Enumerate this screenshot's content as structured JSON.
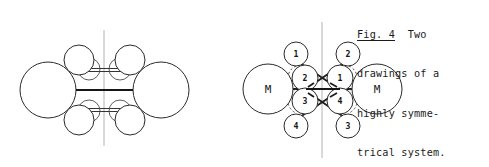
{
  "figure": {
    "caption": {
      "label": "Fig. 4",
      "lines": [
        "Fig. 4  Two",
        "drawings of a",
        "highly symme-",
        "trical system."
      ],
      "full_text": "Fig. 4  Two drawings of a highly symmetrical system."
    },
    "colors": {
      "ink": "#161616",
      "outline": "#2a2a2a",
      "mirror_line": "#a9a9a9",
      "background": "#ffffff"
    },
    "left_diagram": {
      "name": "space-filling-drawing",
      "mirror_axis_label": "",
      "metal_atoms": [
        {
          "id": "metal-left",
          "cx": 48,
          "cy": 90,
          "r": 28
        },
        {
          "id": "metal-right",
          "cx": 161,
          "cy": 90,
          "r": 28
        }
      ],
      "ligand_atoms": [
        {
          "id": "top-left-outer",
          "cx": 79,
          "cy": 60,
          "r": 15
        },
        {
          "id": "top-left-inner",
          "cx": 89,
          "cy": 68,
          "r": 11
        },
        {
          "id": "top-right-outer",
          "cx": 130,
          "cy": 60,
          "r": 15
        },
        {
          "id": "top-right-inner",
          "cx": 120,
          "cy": 68,
          "r": 11
        },
        {
          "id": "bottom-left-outer",
          "cx": 79,
          "cy": 120,
          "r": 15
        },
        {
          "id": "bottom-left-inner",
          "cx": 89,
          "cy": 112,
          "r": 11
        },
        {
          "id": "bottom-right-outer",
          "cx": 130,
          "cy": 120,
          "r": 15
        },
        {
          "id": "bottom-right-inner",
          "cx": 120,
          "cy": 112,
          "r": 11
        }
      ],
      "bonds": [
        {
          "id": "metal-metal-bond",
          "x1": 76,
          "y1": 90,
          "x2": 133,
          "y2": 90,
          "weight": "heavy"
        },
        {
          "id": "top-bridge-bond",
          "x1": 88,
          "y1": 70,
          "x2": 121,
          "y2": 70,
          "weight": "thin"
        },
        {
          "id": "bottom-bridge-bond",
          "x1": 88,
          "y1": 110,
          "x2": 121,
          "y2": 110,
          "weight": "thin"
        }
      ]
    },
    "right_diagram": {
      "name": "schematic-drawing",
      "metal_nodes": [
        {
          "id": "metal-left",
          "label": "M",
          "cx": 268,
          "cy": 89,
          "r": 25
        },
        {
          "id": "metal-right",
          "label": "M",
          "cx": 377,
          "cy": 89,
          "r": 25
        }
      ],
      "ligand_nodes": [
        {
          "id": "node-top-left",
          "label": "1",
          "cx": 296,
          "cy": 54,
          "r": 12
        },
        {
          "id": "node-top-right",
          "label": "2",
          "cx": 348,
          "cy": 54,
          "r": 12
        },
        {
          "id": "node-inner-upper-left",
          "label": "2",
          "cx": 305,
          "cy": 78,
          "r": 13
        },
        {
          "id": "node-inner-upper-right",
          "label": "1",
          "cx": 340,
          "cy": 78,
          "r": 13
        },
        {
          "id": "node-inner-lower-left",
          "label": "3",
          "cx": 305,
          "cy": 101,
          "r": 13
        },
        {
          "id": "node-inner-lower-right",
          "label": "4",
          "cx": 340,
          "cy": 101,
          "r": 13
        },
        {
          "id": "node-bottom-left",
          "label": "4",
          "cx": 296,
          "cy": 126,
          "r": 12
        },
        {
          "id": "node-bottom-right",
          "label": "3",
          "cx": 348,
          "cy": 126,
          "r": 12
        }
      ],
      "bonds": [
        {
          "id": "metal-metal-bond",
          "x1": 292,
          "y1": 89,
          "x2": 353,
          "y2": 89,
          "weight": "heavy"
        },
        {
          "id": "cross-bond-upper-a",
          "x1": 299,
          "y1": 62,
          "x2": 337,
          "y2": 86,
          "weight": "mid"
        },
        {
          "id": "cross-bond-upper-b",
          "x1": 345,
          "y1": 62,
          "x2": 308,
          "y2": 86,
          "weight": "mid"
        },
        {
          "id": "cross-bond-lower-a",
          "x1": 299,
          "y1": 118,
          "x2": 337,
          "y2": 94,
          "weight": "mid"
        },
        {
          "id": "cross-bond-lower-b",
          "x1": 345,
          "y1": 118,
          "x2": 308,
          "y2": 94,
          "weight": "mid"
        }
      ]
    }
  }
}
